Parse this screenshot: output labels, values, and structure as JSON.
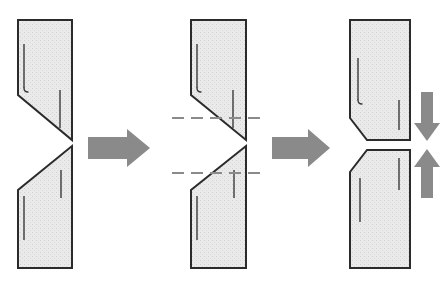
{
  "diagram": {
    "type": "technical-illustration",
    "canvas": {
      "width": 448,
      "height": 287
    },
    "colors": {
      "part_fill": "#e9e9e9",
      "part_stroke": "#2b2b2b",
      "arrow_fill": "#8a8a8a",
      "dash_line": "#8a8a8a",
      "background": "#ffffff",
      "hatch_dot": "#cfcfcf"
    },
    "panels": [
      {
        "id": "panel-1",
        "label": "stage-1-offset-diagonal-cut",
        "upper_part": {
          "name": "upper-workpiece",
          "points": "18,20 72,20 72,140 18,95",
          "description": "Quadrilateral with diagonal lower edge sloping down to the right",
          "tick_marks": [
            {
              "name": "hook-tick",
              "x1": 24,
              "y1": 44,
              "x2": 24,
              "y2": 88,
              "hook": true
            },
            {
              "name": "plain-tick",
              "x1": 60,
              "y1": 90,
              "x2": 60,
              "y2": 128,
              "hook": false
            }
          ]
        },
        "lower_part": {
          "name": "lower-workpiece",
          "points": "72,146 72,268 18,268 18,190",
          "description": "Quadrilateral with diagonal upper edge sloping down to the left",
          "tick_marks": [
            {
              "name": "plain-tick",
              "x1": 61,
              "y1": 170,
              "x2": 61,
              "y2": 198,
              "hook": false
            },
            {
              "name": "plain-tick",
              "x1": 24,
              "y1": 196,
              "x2": 24,
              "y2": 240,
              "hook": false
            }
          ]
        },
        "dashed_guides": []
      },
      {
        "id": "panel-2",
        "label": "stage-2-aligned-with-reference-lines",
        "upper_part": {
          "name": "upper-workpiece",
          "points": "191,20 246,20 246,140 191,95",
          "description": "Same quadrilateral aligned so apex meets the lower part apex",
          "tick_marks": [
            {
              "name": "hook-tick",
              "x1": 197,
              "y1": 44,
              "x2": 197,
              "y2": 88,
              "hook": true
            },
            {
              "name": "plain-tick",
              "x1": 233,
              "y1": 90,
              "x2": 233,
              "y2": 128,
              "hook": false
            }
          ]
        },
        "lower_part": {
          "name": "lower-workpiece",
          "points": "246,146 246,268 191,268 191,190",
          "description": "Lower quadrilateral meeting the upper at a single apex point",
          "tick_marks": [
            {
              "name": "plain-tick",
              "x1": 234,
              "y1": 170,
              "x2": 234,
              "y2": 198,
              "hook": false
            },
            {
              "name": "plain-tick",
              "x1": 197,
              "y1": 196,
              "x2": 197,
              "y2": 240,
              "hook": false
            }
          ]
        },
        "dashed_guides": [
          {
            "name": "upper-reference-line",
            "x1": 172,
            "y1": 118,
            "x2": 266,
            "y2": 118
          },
          {
            "name": "lower-reference-line",
            "x1": 172,
            "y1": 173,
            "x2": 266,
            "y2": 173
          }
        ]
      },
      {
        "id": "panel-3",
        "label": "stage-3-separated-chamfered-parts",
        "upper_part": {
          "name": "upper-workpiece",
          "points": "350,20 410,20 410,140 367,140 350,118",
          "description": "Workpiece with chamfered bottom-left corner, moved downward",
          "tick_marks": [
            {
              "name": "hook-tick",
              "x1": 358,
              "y1": 58,
              "x2": 358,
              "y2": 100,
              "hook": true
            },
            {
              "name": "plain-tick",
              "x1": 399,
              "y1": 100,
              "x2": 399,
              "y2": 130,
              "hook": false
            }
          ]
        },
        "lower_part": {
          "name": "lower-workpiece",
          "points": "367,150 410,150 410,268 350,268 350,172",
          "description": "Workpiece with chamfered top-left corner, moved upward",
          "tick_marks": [
            {
              "name": "plain-tick",
              "x1": 399,
              "y1": 158,
              "x2": 399,
              "y2": 190,
              "hook": false
            },
            {
              "name": "plain-tick",
              "x1": 360,
              "y1": 178,
              "x2": 360,
              "y2": 222,
              "hook": false
            }
          ]
        },
        "dashed_guides": []
      }
    ],
    "arrows": [
      {
        "id": "arrow-stage-1-to-2",
        "name": "process-arrow-right",
        "direction": "right",
        "points": "88,137 127,137 127,129 150,148 127,167 127,159 88,159"
      },
      {
        "id": "arrow-stage-2-to-3",
        "name": "process-arrow-right",
        "direction": "right",
        "points": "272,137 308,137 308,129 330,148 308,167 308,159 272,159"
      },
      {
        "id": "arrow-upper-part-down",
        "name": "motion-arrow-down",
        "direction": "down",
        "points": "421,92 433,92 433,123 440,123 427,141 414,123 421,123"
      },
      {
        "id": "arrow-lower-part-up",
        "name": "motion-arrow-up",
        "direction": "up",
        "points": "421,198 421,167 414,167 427,149 440,167 433,167 433,198"
      }
    ]
  }
}
